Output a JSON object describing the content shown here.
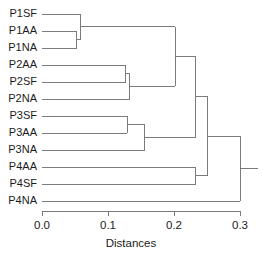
{
  "figure": {
    "background": "#ffffff",
    "line_color": "#6e6e6e",
    "text_color": "#1b1b1b"
  },
  "axis": {
    "title": "Distances",
    "tick_labels": [
      "0.0",
      "0.1",
      "0.2",
      "0.3"
    ],
    "tick_values": [
      0.0,
      0.1,
      0.2,
      0.3
    ],
    "range": [
      0.0,
      0.3
    ]
  },
  "chart_data": {
    "type": "dendrogram",
    "title": "",
    "xlabel": "Distances",
    "ylabel": "",
    "xlim": [
      0.0,
      0.3
    ],
    "grid": false,
    "legend": false,
    "orientation": "horizontal-left-to-right",
    "leaf_labels": [
      "P1SF",
      "P1AA",
      "P1NA",
      "P2AA",
      "P2SF",
      "P2NA",
      "P3SF",
      "P3AA",
      "P3NA",
      "P4AA",
      "P4SF",
      "P4NA"
    ],
    "leaf_order": [
      "P1SF",
      "P1AA",
      "P1NA",
      "P2AA",
      "P2SF",
      "P2NA",
      "P3SF",
      "P3AA",
      "P3NA",
      "P4AA",
      "P4SF",
      "P4NA"
    ],
    "axis_ticks": [
      {
        "label": "0.0",
        "value": 0.0
      },
      {
        "label": "0.1",
        "value": 0.1
      },
      {
        "label": "0.2",
        "value": 0.2
      },
      {
        "label": "0.3",
        "value": 0.3
      }
    ],
    "merges": [
      {
        "id": "m1",
        "left": "P1AA",
        "right": "P1NA",
        "distance": 0.053
      },
      {
        "id": "m2",
        "left": "P1SF",
        "right": "m1",
        "distance": 0.059
      },
      {
        "id": "m3",
        "left": "P2AA",
        "right": "P2SF",
        "distance": 0.127
      },
      {
        "id": "m4",
        "left": "m3",
        "right": "P2NA",
        "distance": 0.133
      },
      {
        "id": "m5",
        "left": "P3SF",
        "right": "P3AA",
        "distance": 0.129
      },
      {
        "id": "m6",
        "left": "m5",
        "right": "P3NA",
        "distance": 0.156
      },
      {
        "id": "m7",
        "left": "m2",
        "right": "m4",
        "distance": 0.202
      },
      {
        "id": "m8",
        "left": "P4AA",
        "right": "P4SF",
        "distance": 0.233
      },
      {
        "id": "m9",
        "left": "m7",
        "right": "m6",
        "distance": 0.233
      },
      {
        "id": "m10",
        "left": "m9",
        "right": "m8",
        "distance": 0.251
      },
      {
        "id": "m11",
        "left": "m10",
        "right": "P4NA",
        "distance": 0.3
      }
    ]
  },
  "geometry": {
    "x_zero_px": 42,
    "px_per_unit": 660,
    "leaf_y_start": 14,
    "leaf_y_step": 17,
    "axis_y": 211,
    "tick_len": 5,
    "label_gap": 5
  }
}
